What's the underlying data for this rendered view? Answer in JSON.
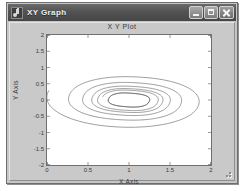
{
  "window": {
    "title": "XY Graph",
    "icon": "xy-graph-icon",
    "buttons": {
      "minimize": "minimize-button",
      "maximize": "maximize-button",
      "close": "close-button"
    },
    "resize_grip": "resize-grip"
  },
  "chart_data": {
    "type": "line",
    "title": "X Y Plot",
    "xlabel": "X Axis",
    "ylabel": "Y Axis",
    "xlim": [
      0,
      2
    ],
    "ylim": [
      -2,
      2
    ],
    "xticks": [
      "0",
      "0.5",
      "1",
      "1.5",
      "2"
    ],
    "xtick_values": [
      0,
      0.5,
      1,
      1.5,
      2
    ],
    "yticks": [
      "2",
      "1.5",
      "1",
      "0.5",
      "0",
      "-0.5",
      "-1",
      "-1.5",
      "-2"
    ],
    "ytick_values": [
      2,
      1.5,
      1,
      0.5,
      0,
      -0.5,
      -1,
      -1.5,
      -2
    ],
    "grid": false,
    "legend": null,
    "line_color": "#4a4a4a",
    "background": "#ffffff",
    "series": [
      {
        "name": "trajectory",
        "center": [
          1.0,
          0.0
        ],
        "start_point": [
          0.0,
          0.28
        ],
        "end_point": [
          0.78,
          0.12
        ],
        "turns": 5,
        "radii_x": [
          1.02,
          0.62,
          0.43,
          0.33,
          0.28,
          0.255,
          0.25
        ],
        "radii_y": [
          0.92,
          0.55,
          0.38,
          0.28,
          0.235,
          0.215,
          0.21
        ],
        "limit_cycle_rx": 0.25,
        "limit_cycle_ry": 0.21,
        "rotation_deg": -12
      }
    ]
  }
}
